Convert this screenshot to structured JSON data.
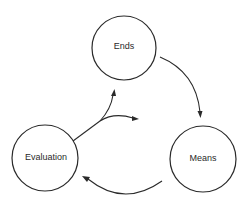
{
  "diagram": {
    "type": "cycle",
    "nodes": [
      {
        "id": "ends",
        "label": "Ends"
      },
      {
        "id": "means",
        "label": "Means"
      },
      {
        "id": "evaluation",
        "label": "Evaluation"
      }
    ],
    "edges": [
      {
        "from": "ends",
        "to": "means"
      },
      {
        "from": "means",
        "to": "evaluation"
      },
      {
        "from": "evaluation",
        "to": "ends",
        "note": "branching arrow"
      },
      {
        "from": "evaluation",
        "to": "means",
        "note": "branching arrow"
      }
    ],
    "colors": {
      "stroke": "#2a2a2a",
      "background": "#ffffff"
    }
  }
}
